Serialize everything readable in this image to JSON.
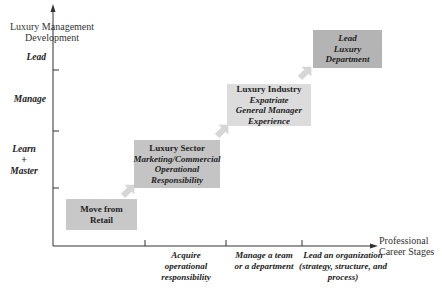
{
  "y_axis": {
    "title_line1": "Luxury Management",
    "title_line2": "Development",
    "levels": [
      {
        "label": "Lead"
      },
      {
        "label": "Manage"
      },
      {
        "label_line1": "Learn",
        "label_line2": "+",
        "label_line3": "Master"
      }
    ]
  },
  "x_axis": {
    "title_line1": "Professional",
    "title_line2": "Career Stages",
    "stages": [
      {
        "lines": [
          "Acquire",
          "operational",
          "responsibility"
        ]
      },
      {
        "lines": [
          "Manage a team",
          "or a department"
        ]
      },
      {
        "lines": [
          "Lead an organization",
          "(strategy, structure, and",
          "process)"
        ]
      }
    ]
  },
  "boxes": [
    {
      "title": "Move from",
      "title2": "Retail",
      "color": "#c8c8c8"
    },
    {
      "title": "Luxury Sector",
      "sub1": "Marketing/Commercial",
      "sub2": "Operational",
      "sub3": "Responsibility",
      "color": "#c4c4c4"
    },
    {
      "title": "Luxury Industry",
      "sub1": "Expatriate",
      "sub2": "General Manager",
      "sub3": "Experience",
      "color": "#dcdcdc"
    },
    {
      "sub1": "Lead",
      "sub2": "Luxury",
      "sub3": "Department",
      "color": "#b4b4b4"
    }
  ],
  "colors": {
    "axis": "#333333",
    "arrow": "#d4d4d4"
  }
}
